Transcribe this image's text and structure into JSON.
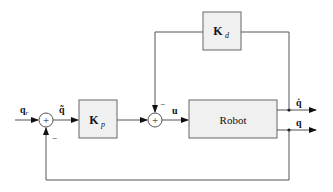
{
  "diagram": {
    "type": "control-block-diagram",
    "blocks": {
      "kp": {
        "label": "K",
        "subscript": "p"
      },
      "kd": {
        "label": "K",
        "subscript": "d"
      },
      "robot": {
        "label": "Robot"
      }
    },
    "signals": {
      "input": {
        "label": "q",
        "subscript": "r"
      },
      "error": {
        "label": "q̃"
      },
      "control": {
        "label": "u"
      },
      "velocity_out": {
        "label": "q̇"
      },
      "position_out": {
        "label": "q"
      }
    },
    "junctions": {
      "sum1": {
        "symbol": "+",
        "minus_label": "−"
      },
      "sum2": {
        "symbol": "+",
        "minus_label": "−"
      }
    },
    "colors": {
      "line": "#555555",
      "block_fill": "#f0f0f0",
      "block_stroke": "#666666"
    }
  }
}
